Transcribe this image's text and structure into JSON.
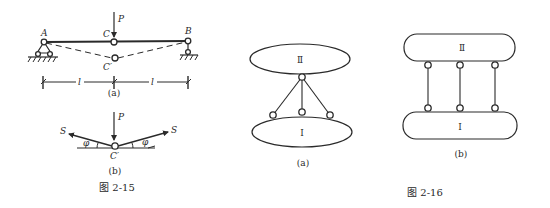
{
  "figure_2_15": {
    "caption": "图 2-15",
    "part_a": {
      "label": "(a)",
      "points": {
        "A": "A",
        "B": "B",
        "C": "C",
        "C_prime": "C′"
      },
      "load": "P",
      "span_labels": [
        "l",
        "l"
      ]
    },
    "part_b": {
      "label": "(b)",
      "load": "P",
      "point": "C′",
      "forces": [
        "S",
        "S"
      ],
      "angles": [
        "φ",
        "φ"
      ]
    }
  },
  "figure_2_16": {
    "caption": "图 2-16",
    "part_a": {
      "label": "(a)",
      "body_top": "Ⅱ",
      "body_bottom": "Ⅰ"
    },
    "part_b": {
      "label": "(b)",
      "body_top": "Ⅱ",
      "body_bottom": "Ⅰ"
    }
  },
  "colors": {
    "ink": "#2a2a2a",
    "paper": "#ffffff"
  }
}
